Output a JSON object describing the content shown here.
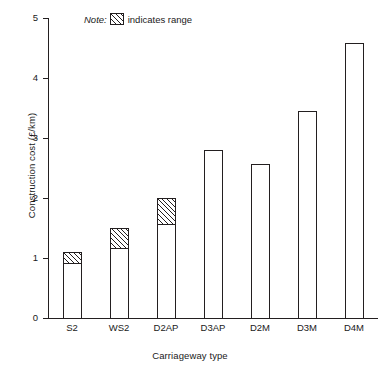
{
  "chart_data": {
    "type": "bar",
    "title": "",
    "xlabel": "Carriageway type",
    "ylabel": "Construction cost (£/km)",
    "categories": [
      "S2",
      "WS2",
      "D2AP",
      "D3AP",
      "D2M",
      "D3M",
      "D4M"
    ],
    "values": [
      1.1,
      1.5,
      2.0,
      2.8,
      2.57,
      3.45,
      4.58
    ],
    "ranges": [
      {
        "category": "S2",
        "low": 0.9,
        "high": 1.1
      },
      {
        "category": "WS2",
        "low": 1.15,
        "high": 1.5
      },
      {
        "category": "D2AP",
        "low": 1.55,
        "high": 2.0
      },
      {
        "category": "D3AP",
        "low": null,
        "high": null
      },
      {
        "category": "D2M",
        "low": null,
        "high": null
      },
      {
        "category": "D3M",
        "low": null,
        "high": null
      },
      {
        "category": "D4M",
        "low": null,
        "high": null
      }
    ],
    "ylim": [
      0,
      5
    ],
    "yticks": [
      0,
      1,
      2,
      3,
      4,
      5
    ],
    "ytick_labels": [
      "0",
      "1",
      "2",
      "3",
      "4",
      "5"
    ],
    "grid": false,
    "legend_position": "top-left-inside",
    "annotations": [
      {
        "name": "note",
        "text": "indicates range",
        "prefix": "Note:"
      }
    ]
  },
  "legend": {
    "note_label": "Note:",
    "swatch_name": "hatched-range-swatch",
    "text": "indicates range"
  },
  "colors": {
    "ink": "#231f20",
    "background": "#ffffff"
  }
}
